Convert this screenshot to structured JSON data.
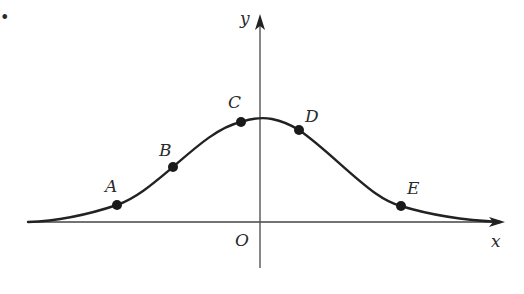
{
  "diagram": {
    "type": "bell-curve-graph",
    "colors": {
      "stroke": "#222222",
      "axis": "#444444",
      "point": "#1a1a1a",
      "background": "#ffffff"
    },
    "axes": {
      "x_label": "x",
      "y_label": "y",
      "origin_label": "O"
    },
    "points": [
      {
        "label": "A",
        "x": 117,
        "y": 205
      },
      {
        "label": "B",
        "x": 173,
        "y": 167
      },
      {
        "label": "C",
        "x": 241,
        "y": 122
      },
      {
        "label": "D",
        "x": 299,
        "y": 130
      },
      {
        "label": "E",
        "x": 401,
        "y": 206
      }
    ],
    "stray_mark": "•"
  }
}
